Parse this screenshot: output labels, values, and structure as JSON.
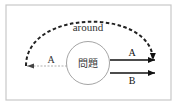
{
  "diagram": {
    "center_label": "問題",
    "arc_label": "around",
    "left_arrow_label": "A",
    "right_arrows": [
      {
        "label": "A"
      },
      {
        "label": "B"
      }
    ],
    "colors": {
      "frame": "#c8c8c8",
      "circle": "#9a9a9a",
      "arc": "#222222",
      "left_dashed": "#b0b0b0",
      "solid_arrows": "#111111",
      "text": "#333333"
    }
  }
}
